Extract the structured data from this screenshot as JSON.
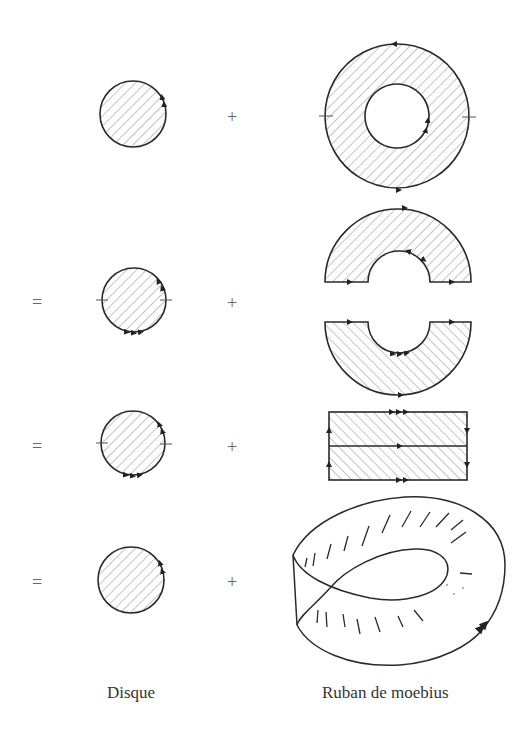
{
  "figure": {
    "colors": {
      "stroke": "#2a2a2a",
      "hatch": "#8a8a8a",
      "background": "#ffffff"
    },
    "rows": [
      {
        "index": 1,
        "equals": "",
        "plus": "+",
        "left": "disque (arrow on boundary)",
        "right": "anneau (annulus) with arrows"
      },
      {
        "index": 2,
        "equals": "=",
        "plus": "+",
        "left": "disque with two tick marks, arrows",
        "right": "two half-annuli"
      },
      {
        "index": 3,
        "equals": "=",
        "plus": "+",
        "left": "disque with two tick marks, arrows",
        "right": "rectangle split in two"
      },
      {
        "index": 4,
        "equals": "=",
        "plus": "+",
        "left": "disque",
        "right": "ruban de moebius (3D sketch)"
      }
    ],
    "captions": {
      "left": "Disque",
      "right": "Ruban de moebius"
    }
  }
}
